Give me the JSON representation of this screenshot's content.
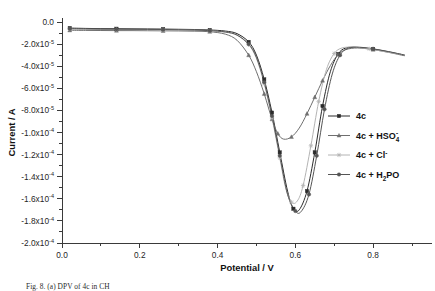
{
  "figure": {
    "caption": "Fig. 8. (a) DPV of 4c in CH"
  },
  "axes": {
    "x_title": "Potential / V",
    "y_title": "Current / A",
    "x_ticks": [
      "0.0",
      "0.2",
      "0.4",
      "0.6",
      "0.8"
    ],
    "y_ticks": [
      {
        "mantissa": "0.0",
        "exp": ""
      },
      {
        "mantissa": "-2.0x10",
        "exp": "-5"
      },
      {
        "mantissa": "-4.0x10",
        "exp": "-5"
      },
      {
        "mantissa": "-6.0x10",
        "exp": "-5"
      },
      {
        "mantissa": "-8.0x10",
        "exp": "-5"
      },
      {
        "mantissa": "-1.0x10",
        "exp": "-4"
      },
      {
        "mantissa": "-1.2x10",
        "exp": "-4"
      },
      {
        "mantissa": "-1.4x10",
        "exp": "-4"
      },
      {
        "mantissa": "-1.6x10",
        "exp": "-4"
      },
      {
        "mantissa": "-1.8x10",
        "exp": "-4"
      },
      {
        "mantissa": "-2.0x10",
        "exp": "-4"
      }
    ]
  },
  "legend": {
    "entries": [
      {
        "label": "4c",
        "sub": "",
        "sup": "",
        "tail": "",
        "color": "#2b2b2b",
        "marker": "square"
      },
      {
        "label": "4c + HSO",
        "sub": "4",
        "sup": "-",
        "tail": "",
        "color": "#6f6f6f",
        "marker": "triangle"
      },
      {
        "label": "4c + Cl",
        "sub": "",
        "sup": "-",
        "tail": "",
        "color": "#b4b4b4",
        "marker": "star"
      },
      {
        "label": "4c + H",
        "sub": "2",
        "sup": "",
        "tail": "PO",
        "color": "#555555",
        "marker": "circle"
      }
    ]
  },
  "chart_data": {
    "type": "line",
    "title": "",
    "xlabel": "Potential / V",
    "ylabel": "Current / A",
    "xlim": [
      0.0,
      0.9
    ],
    "ylim": [
      -0.0002,
      0.0
    ],
    "grid": false,
    "legend_position": "center-right",
    "y_tick_values": [
      0.0,
      -2e-05,
      -4e-05,
      -6e-05,
      -8e-05,
      -0.0001,
      -0.00012,
      -0.00014,
      -0.00016,
      -0.00018,
      -0.0002
    ],
    "x_tick_values": [
      0.0,
      0.2,
      0.4,
      0.6,
      0.8
    ],
    "series": [
      {
        "name": "4c",
        "color": "#2b2b2b",
        "marker": "square",
        "x": [
          0.02,
          0.06,
          0.1,
          0.14,
          0.18,
          0.22,
          0.26,
          0.3,
          0.34,
          0.38,
          0.42,
          0.45,
          0.48,
          0.5,
          0.52,
          0.54,
          0.56,
          0.58,
          0.595,
          0.61,
          0.63,
          0.65,
          0.67,
          0.69,
          0.71,
          0.73,
          0.76,
          0.8,
          0.84,
          0.88
        ],
        "y": [
          -5.5e-06,
          -5.8e-06,
          -6e-06,
          -6.1e-06,
          -6.2e-06,
          -6.3e-06,
          -6.4e-06,
          -6.6e-06,
          -6.8e-06,
          -7.2e-06,
          -8.2e-06,
          -1.05e-05,
          -1.8e-05,
          -3e-05,
          -5.2e-05,
          -8.2e-05,
          -0.000118,
          -0.000153,
          -0.000169,
          -0.00017,
          -0.000153,
          -0.000118,
          -7.6e-05,
          -4.5e-05,
          -2.9e-05,
          -2.35e-05,
          -2.3e-05,
          -2.45e-05,
          -2.7e-05,
          -3e-05
        ]
      },
      {
        "name": "4c + HSO4-",
        "color": "#6f6f6f",
        "marker": "triangle",
        "x": [
          0.02,
          0.06,
          0.1,
          0.14,
          0.18,
          0.22,
          0.26,
          0.3,
          0.34,
          0.38,
          0.42,
          0.45,
          0.48,
          0.5,
          0.52,
          0.54,
          0.555,
          0.57,
          0.59,
          0.61,
          0.63,
          0.65,
          0.67,
          0.69,
          0.71,
          0.73,
          0.76,
          0.8,
          0.84,
          0.88
        ],
        "y": [
          -7.5e-06,
          -7.6e-06,
          -7.7e-06,
          -7.8e-06,
          -7.8e-06,
          -7.9e-06,
          -8e-06,
          -8.1e-06,
          -8.3e-06,
          -8.8e-06,
          -1.1e-05,
          -1.65e-05,
          -3e-05,
          -4.5e-05,
          -6.5e-05,
          -8.8e-05,
          -0.000101,
          -0.000106,
          -0.000104,
          -9.6e-05,
          -8.3e-05,
          -6.8e-05,
          -5.3e-05,
          -3.95e-05,
          -2.95e-05,
          -2.5e-05,
          -2.35e-05,
          -2.5e-05,
          -2.75e-05,
          -3.05e-05
        ]
      },
      {
        "name": "4c + Cl-",
        "color": "#b4b4b4",
        "marker": "star",
        "x": [
          0.02,
          0.06,
          0.1,
          0.14,
          0.18,
          0.22,
          0.26,
          0.3,
          0.34,
          0.38,
          0.42,
          0.45,
          0.48,
          0.5,
          0.52,
          0.54,
          0.56,
          0.575,
          0.59,
          0.605,
          0.62,
          0.64,
          0.66,
          0.68,
          0.7,
          0.72,
          0.75,
          0.79,
          0.83,
          0.88
        ],
        "y": [
          -6.5e-06,
          -6.6e-06,
          -6.7e-06,
          -6.8e-06,
          -6.9e-06,
          -7e-06,
          -7.1e-06,
          -7.2e-06,
          -7.4e-06,
          -7.9e-06,
          -9.2e-06,
          -1.2e-05,
          -2.05e-05,
          -3.3e-05,
          -5.6e-05,
          -8.7e-05,
          -0.000123,
          -0.00015,
          -0.000163,
          -0.000162,
          -0.000148,
          -0.000112,
          -7.2e-05,
          -4.3e-05,
          -2.85e-05,
          -2.35e-05,
          -2.28e-05,
          -2.43e-05,
          -2.68e-05,
          -2.98e-05
        ]
      },
      {
        "name": "4c + H2PO4-",
        "color": "#555555",
        "marker": "circle",
        "x": [
          0.02,
          0.06,
          0.1,
          0.14,
          0.18,
          0.22,
          0.26,
          0.3,
          0.34,
          0.38,
          0.42,
          0.45,
          0.48,
          0.5,
          0.52,
          0.54,
          0.56,
          0.58,
          0.6,
          0.615,
          0.635,
          0.655,
          0.675,
          0.695,
          0.715,
          0.735,
          0.765,
          0.8,
          0.84,
          0.88
        ],
        "y": [
          -6e-06,
          -6.2e-06,
          -6.4e-06,
          -6.5e-06,
          -6.6e-06,
          -6.7e-06,
          -6.8e-06,
          -7e-06,
          -7.3e-06,
          -7.8e-06,
          -9e-06,
          -1.18e-05,
          -2e-05,
          -3.2e-05,
          -5.45e-05,
          -8.5e-05,
          -0.000121,
          -0.000156,
          -0.000171,
          -0.0001715,
          -0.000156,
          -0.000121,
          -7.9e-05,
          -4.7e-05,
          -3e-05,
          -2.38e-05,
          -2.28e-05,
          -2.43e-05,
          -2.68e-05,
          -2.98e-05
        ]
      }
    ]
  }
}
